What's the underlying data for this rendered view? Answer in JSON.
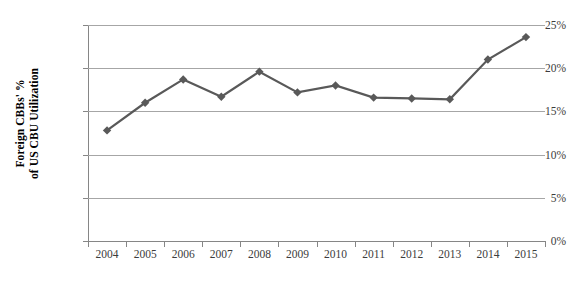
{
  "chart_data": {
    "type": "line",
    "title": "",
    "xlabel": "",
    "ylabel": "Foreign CBBs' % of US CBU Utilization",
    "ylabel_lines": [
      "Foreign CBBs' %",
      "of US CBU Utilization"
    ],
    "categories": [
      "2004",
      "2005",
      "2006",
      "2007",
      "2008",
      "2009",
      "2010",
      "2011",
      "2012",
      "2013",
      "2014",
      "2015"
    ],
    "values": [
      12.8,
      16.0,
      18.7,
      16.7,
      19.6,
      17.2,
      18.0,
      16.6,
      16.5,
      16.4,
      21.0,
      23.6
    ],
    "series": [
      {
        "name": "Foreign CBBs' % of US CBU Utilization",
        "values": [
          12.8,
          16.0,
          18.7,
          16.7,
          19.6,
          17.2,
          18.0,
          16.6,
          16.5,
          16.4,
          21.0,
          23.6
        ]
      }
    ],
    "ylim": [
      0,
      25
    ],
    "ytick_values": [
      0,
      5,
      10,
      15,
      20,
      25
    ],
    "ytick_labels": [
      "0%",
      "5%",
      "10%",
      "15%",
      "20%",
      "25%"
    ],
    "grid": true,
    "grid_axis": "y",
    "legend": false,
    "legend_position": "none",
    "marker": "diamond",
    "line_color": "#595959",
    "marker_color": "#595959",
    "grid_color": "#a6a6a6",
    "axis_color": "#868686",
    "background_color": "#ffffff",
    "text_color": "#3c3c3c"
  }
}
